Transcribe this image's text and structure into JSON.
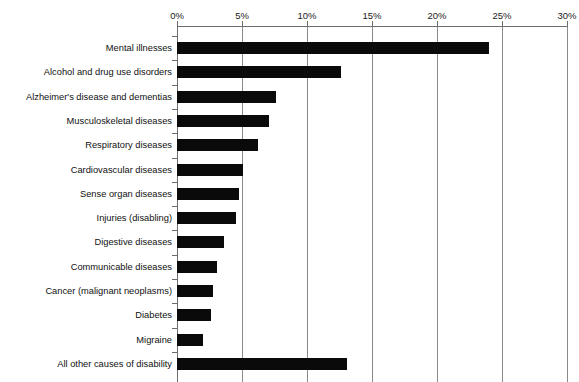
{
  "chart_data": {
    "type": "bar",
    "orientation": "horizontal",
    "title": "",
    "xlabel": "",
    "ylabel": "",
    "xlim": [
      0,
      30
    ],
    "tick_labels": [
      "0%",
      "5%",
      "10%",
      "15%",
      "20%",
      "25%",
      "30%"
    ],
    "tick_values": [
      0,
      5,
      10,
      15,
      20,
      25,
      30
    ],
    "grid": "vertical",
    "legend": "none",
    "value_suffix": "%",
    "categories": [
      "Mental illnesses",
      "Alcohol and drug use disorders",
      "Alzheimer's disease and dementias",
      "Musculoskeletal diseases",
      "Respiratory diseases",
      "Cardiovascular diseases",
      "Sense organ diseases",
      "Injuries (disabling)",
      "Digestive diseases",
      "Communicable diseases",
      "Cancer (malignant neoplasms)",
      "Diabetes",
      "Migraine",
      "All other causes of disability"
    ],
    "values": [
      24.0,
      12.6,
      7.6,
      7.1,
      6.2,
      5.1,
      4.8,
      4.5,
      3.6,
      3.1,
      2.8,
      2.6,
      2.0,
      13.1
    ],
    "bar_color": "#0a0a0a",
    "grid_color": "#8a8a8a",
    "axis_color": "#6e6e6e",
    "background": "#ffffff"
  }
}
